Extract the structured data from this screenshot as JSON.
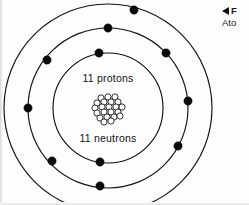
{
  "figure": {
    "nucleus": {
      "protons_label": "11 protons",
      "neutrons_label": "11 neutrons",
      "proton_count": 11,
      "neutron_count": 11,
      "nucleon_circle_count": 22
    },
    "caption": {
      "marker": "left-triangle",
      "line1": "F",
      "line2": "Ato",
      "note_cropped": true
    },
    "colors": {
      "ring_stroke": "#111111",
      "electron_fill": "#0a0a0a",
      "nucleon_stroke": "#111111",
      "nucleon_fill": "#ffffff",
      "text": "#121212",
      "background": "#fdfdfd"
    },
    "center": {
      "cx": 108,
      "cy": 108
    },
    "shells": [
      {
        "name": "shell-1",
        "radius": 55,
        "electron_count": 2,
        "electrons": [
          {
            "x": 99,
            "y": 53
          },
          {
            "x": 100,
            "y": 162
          }
        ]
      },
      {
        "name": "shell-2",
        "radius": 80,
        "electron_count": 8,
        "electrons": [
          {
            "x": 47,
            "y": 60
          },
          {
            "x": 28,
            "y": 108
          },
          {
            "x": 52,
            "y": 161
          },
          {
            "x": 100,
            "y": 186
          },
          {
            "x": 178,
            "y": 146
          },
          {
            "x": 188,
            "y": 101
          },
          {
            "x": 166,
            "y": 53
          },
          {
            "x": 108,
            "y": 28
          }
        ]
      },
      {
        "name": "shell-3",
        "radius": 104,
        "electron_count": 1,
        "electrons": [
          {
            "x": 134,
            "y": 10
          }
        ]
      }
    ],
    "electron_radius": 4.2,
    "nucleons": [
      {
        "x": 101,
        "y": 98
      },
      {
        "x": 108,
        "y": 97
      },
      {
        "x": 115,
        "y": 97
      },
      {
        "x": 97,
        "y": 103
      },
      {
        "x": 104,
        "y": 102
      },
      {
        "x": 111,
        "y": 102
      },
      {
        "x": 118,
        "y": 102
      },
      {
        "x": 95,
        "y": 108
      },
      {
        "x": 102,
        "y": 107
      },
      {
        "x": 109,
        "y": 107
      },
      {
        "x": 116,
        "y": 107
      },
      {
        "x": 122,
        "y": 107
      },
      {
        "x": 97,
        "y": 113
      },
      {
        "x": 104,
        "y": 112
      },
      {
        "x": 111,
        "y": 112
      },
      {
        "x": 118,
        "y": 112
      },
      {
        "x": 100,
        "y": 118
      },
      {
        "x": 107,
        "y": 117
      },
      {
        "x": 114,
        "y": 117
      },
      {
        "x": 120,
        "y": 116
      },
      {
        "x": 104,
        "y": 122
      },
      {
        "x": 111,
        "y": 121
      }
    ],
    "nucleon_radius": 3.1,
    "labels": {
      "protons_x": 108,
      "protons_y": 82,
      "neutrons_x": 108,
      "neutrons_y": 142
    }
  }
}
